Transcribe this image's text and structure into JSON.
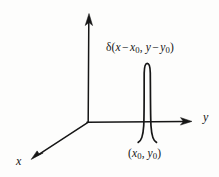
{
  "figure": {
    "background_color": "#fdfdfc",
    "ink_color": "#161616"
  },
  "axes": {
    "vertical": {
      "name": "vertical-axis",
      "label": "",
      "has_arrow": true,
      "from": [
        88,
        122
      ],
      "to": [
        89,
        14
      ]
    },
    "horizontal": {
      "name": "y-axis",
      "label": "y",
      "has_arrow": true,
      "from": [
        88,
        122
      ],
      "to": [
        192,
        122
      ]
    },
    "depth": {
      "name": "x-axis",
      "label": "x",
      "has_arrow": true,
      "from": [
        88,
        122
      ],
      "to": [
        31,
        159
      ]
    },
    "origin": [
      88,
      122
    ]
  },
  "impulse": {
    "name": "delta-impulse-spike",
    "label": "δ(x − x₀, y − y₀)",
    "label_parts": {
      "symbol": "δ",
      "open_paren": "(",
      "var1": "x",
      "minus1": "−",
      "var1_sub_base": "x",
      "var1_sub": "0",
      "comma": ",",
      "var2": "y",
      "minus2": "−",
      "var2_sub_base": "y",
      "var2_sub": "0",
      "close_paren": ")"
    },
    "location_label": "(x₀, y₀)",
    "location_label_parts": {
      "open_paren": "(",
      "x_base": "x",
      "x_sub": "0",
      "comma": ",",
      "y_base": "y",
      "y_sub": "0",
      "close_paren": ")"
    },
    "peak": [
      147,
      62
    ],
    "base_y": 142,
    "width_px": 14
  }
}
